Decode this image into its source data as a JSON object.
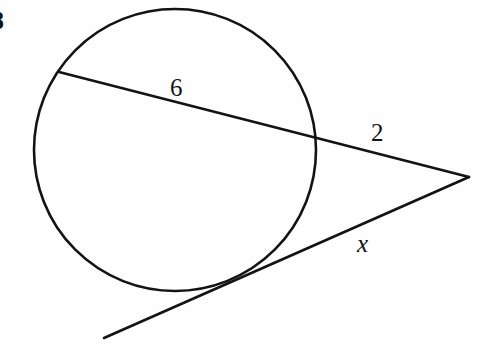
{
  "figure": {
    "background_color": "#fefefe",
    "stroke_color": "#131313",
    "problem_number": "8"
  },
  "labels": {
    "secant_chord_length": "6",
    "secant_external_length": "2",
    "tangent_length": "x"
  },
  "geometry": {
    "circle": {
      "name": "circle",
      "cx": 175,
      "cy": 150,
      "r": 141,
      "stroke_width": 2.6
    },
    "secant_line": {
      "name": "secant-line",
      "x1": 59,
      "y1": 72,
      "x2": 469,
      "y2": 177,
      "stroke_width": 2.6
    },
    "tangent_line": {
      "name": "tangent-line",
      "x1": 104,
      "y1": 338,
      "x2": 469,
      "y2": 177,
      "stroke_width": 2.6
    },
    "external_vertex": {
      "name": "external-point",
      "x": 469,
      "y": 177
    },
    "tangent_point": {
      "name": "tangent-point",
      "x": 250,
      "y": 276
    },
    "secant_entry_point": {
      "name": "secant-entry-point",
      "x": 59,
      "y": 72
    },
    "secant_exit_point": {
      "name": "secant-exit-point",
      "x": 305,
      "y": 145
    }
  },
  "chart_data": {
    "type": "diagram",
    "elements": [
      {
        "kind": "circle",
        "center": [
          175,
          150
        ],
        "radius": 141
      },
      {
        "kind": "secant",
        "from": [
          59,
          72
        ],
        "to": [
          469,
          177
        ],
        "chord_label": "6",
        "external_label": "2"
      },
      {
        "kind": "tangent",
        "from": [
          104,
          338
        ],
        "to": [
          469,
          177
        ],
        "label": "x",
        "touch_point": [
          250,
          276
        ]
      }
    ],
    "annotations": [
      {
        "text": "6",
        "position": [
          180,
          88
        ],
        "refers_to": "secant chord inside circle"
      },
      {
        "text": "2",
        "position": [
          380,
          133
        ],
        "refers_to": "secant segment outside circle"
      },
      {
        "text": "x",
        "position": [
          366,
          244
        ],
        "refers_to": "tangent segment length"
      },
      {
        "text": "8",
        "position": [
          2,
          21
        ],
        "refers_to": "problem number (clipped at left edge)"
      }
    ]
  }
}
